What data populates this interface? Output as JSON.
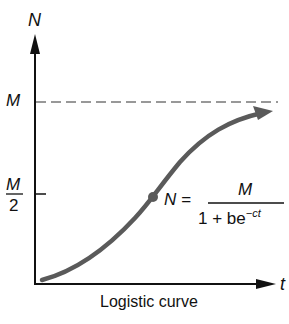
{
  "diagram": {
    "caption": "Logistic curve",
    "y_axis_label": "N",
    "x_axis_label": "t",
    "y_ticks": {
      "upper": "M",
      "half_numerator": "M",
      "half_denominator": "2"
    },
    "equation": {
      "lhs": "N =",
      "numerator": "M",
      "denominator_base": "1 + be",
      "denominator_exponent": "−ct"
    },
    "colors": {
      "axis": "#111111",
      "curve": "#5a5a5a",
      "asymptote": "#777777"
    }
  }
}
